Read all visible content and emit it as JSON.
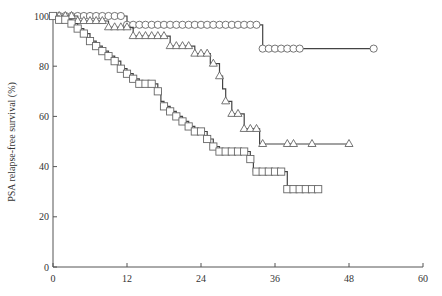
{
  "chart_data": {
    "type": "line",
    "subtype": "kaplan-meier step",
    "title": "",
    "xlabel": "",
    "ylabel": "PSA relapse-free survival (%)",
    "xlim": [
      0,
      60
    ],
    "ylim": [
      0,
      100
    ],
    "xticks": [
      "0",
      "12",
      "24",
      "36",
      "48",
      "60"
    ],
    "yticks": [
      "0",
      "20",
      "40",
      "60",
      "80",
      "100"
    ],
    "grid": false,
    "legend": null,
    "series": [
      {
        "name": "circles",
        "marker": "circle",
        "steps": [
          [
            0,
            100
          ],
          [
            12,
            100
          ],
          [
            12,
            96.5
          ],
          [
            34,
            96.5
          ],
          [
            34,
            87
          ],
          [
            52,
            87
          ]
        ],
        "censor_marks": [
          1,
          2,
          3,
          4,
          5,
          6,
          7,
          8,
          9,
          10,
          11,
          12,
          13,
          14,
          15,
          16,
          17,
          18,
          19,
          20,
          21,
          22,
          23,
          24,
          25,
          26,
          27,
          28,
          29,
          30,
          31,
          32,
          33,
          34,
          35,
          36,
          37,
          38,
          39,
          40,
          52
        ]
      },
      {
        "name": "triangles",
        "marker": "triangle",
        "steps": [
          [
            0,
            100
          ],
          [
            4,
            100
          ],
          [
            4,
            98
          ],
          [
            9,
            98
          ],
          [
            9,
            95.5
          ],
          [
            13,
            95.5
          ],
          [
            13,
            92
          ],
          [
            19,
            92
          ],
          [
            19,
            88
          ],
          [
            23,
            88
          ],
          [
            23,
            85
          ],
          [
            25.5,
            85
          ],
          [
            25.5,
            81
          ],
          [
            27,
            81
          ],
          [
            27,
            76
          ],
          [
            27.5,
            76
          ],
          [
            27.5,
            71
          ],
          [
            28,
            71
          ],
          [
            28,
            66
          ],
          [
            29,
            66
          ],
          [
            29,
            61
          ],
          [
            31,
            61
          ],
          [
            31,
            55
          ],
          [
            33.5,
            55
          ],
          [
            33.5,
            49
          ],
          [
            48,
            49
          ]
        ],
        "censor_marks": [
          1,
          2,
          3,
          4,
          5,
          6,
          7,
          8,
          9,
          10,
          11,
          12,
          13,
          14,
          15,
          16,
          17,
          18,
          19,
          20,
          21,
          22,
          23,
          24,
          25,
          26,
          27,
          28,
          29,
          30,
          31,
          32,
          33,
          34,
          38,
          39,
          42,
          48
        ]
      },
      {
        "name": "squares",
        "marker": "square",
        "steps": [
          [
            0,
            100
          ],
          [
            1,
            100
          ],
          [
            1,
            98.5
          ],
          [
            3,
            98.5
          ],
          [
            3,
            97
          ],
          [
            4,
            97
          ],
          [
            4,
            95
          ],
          [
            5,
            95
          ],
          [
            5,
            93
          ],
          [
            6,
            93
          ],
          [
            6,
            90
          ],
          [
            7,
            90
          ],
          [
            7,
            88
          ],
          [
            8,
            88
          ],
          [
            8,
            86
          ],
          [
            9,
            86
          ],
          [
            9,
            84
          ],
          [
            10,
            84
          ],
          [
            10,
            82
          ],
          [
            11,
            82
          ],
          [
            11,
            79
          ],
          [
            12,
            79
          ],
          [
            12,
            77
          ],
          [
            13,
            77
          ],
          [
            13,
            75
          ],
          [
            14,
            75
          ],
          [
            14,
            73
          ],
          [
            17,
            73
          ],
          [
            17,
            70
          ],
          [
            17.5,
            70
          ],
          [
            17.5,
            66
          ],
          [
            18,
            66
          ],
          [
            18,
            64
          ],
          [
            19,
            64
          ],
          [
            19,
            62
          ],
          [
            20,
            62
          ],
          [
            20,
            60
          ],
          [
            21,
            60
          ],
          [
            21,
            58
          ],
          [
            22,
            58
          ],
          [
            22,
            56
          ],
          [
            23,
            56
          ],
          [
            23,
            54
          ],
          [
            25,
            54
          ],
          [
            25,
            51
          ],
          [
            26,
            51
          ],
          [
            26,
            48
          ],
          [
            27,
            48
          ],
          [
            27,
            46
          ],
          [
            32,
            46
          ],
          [
            32,
            43
          ],
          [
            32.5,
            43
          ],
          [
            32.5,
            38
          ],
          [
            38,
            38
          ],
          [
            38,
            31
          ],
          [
            43,
            31
          ]
        ],
        "censor_marks": [
          0,
          1,
          2,
          3,
          4,
          5,
          6,
          7,
          8,
          9,
          10,
          11,
          12,
          13,
          14,
          15,
          16,
          17,
          18,
          19,
          20,
          21,
          22,
          23,
          24,
          25,
          26,
          27,
          28,
          29,
          30,
          31,
          32,
          33,
          34,
          35,
          36,
          37,
          38,
          39,
          40,
          41,
          42,
          43
        ]
      }
    ]
  }
}
